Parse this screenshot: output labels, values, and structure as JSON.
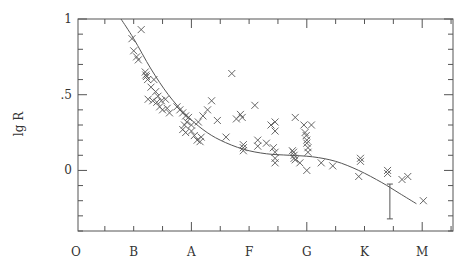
{
  "chart_data": {
    "type": "scatter",
    "title": "",
    "xlabel": "",
    "ylabel": "lg R",
    "x_categories": [
      "O",
      "B",
      "A",
      "F",
      "G",
      "K",
      "M"
    ],
    "x_category_positions": [
      0,
      1,
      2,
      3,
      4,
      5,
      6
    ],
    "xlim": [
      0.03,
      6.53
    ],
    "ylim": [
      -0.4,
      1.0
    ],
    "y_ticks": [
      {
        "value": 1,
        "label": "1"
      },
      {
        "value": 0.5,
        "label": ".5"
      },
      {
        "value": 0,
        "label": "0"
      }
    ],
    "y_minor_step": 0.1,
    "x_minor_step": 0.5,
    "grid": false,
    "legend": null,
    "marker": "x",
    "series": [
      {
        "name": "stars",
        "points": [
          [
            1.13,
            0.93
          ],
          [
            0.97,
            0.87
          ],
          [
            1.0,
            0.79
          ],
          [
            1.05,
            0.75
          ],
          [
            1.08,
            0.73
          ],
          [
            1.2,
            0.65
          ],
          [
            1.22,
            0.62
          ],
          [
            1.24,
            0.6
          ],
          [
            1.21,
            0.63
          ],
          [
            1.35,
            0.6
          ],
          [
            1.3,
            0.55
          ],
          [
            1.38,
            0.52
          ],
          [
            1.42,
            0.49
          ],
          [
            1.25,
            0.47
          ],
          [
            1.33,
            0.46
          ],
          [
            1.4,
            0.45
          ],
          [
            1.48,
            0.46
          ],
          [
            1.55,
            0.47
          ],
          [
            1.45,
            0.42
          ],
          [
            1.5,
            0.4
          ],
          [
            1.58,
            0.41
          ],
          [
            1.62,
            0.38
          ],
          [
            1.75,
            0.42
          ],
          [
            1.8,
            0.4
          ],
          [
            1.85,
            0.38
          ],
          [
            1.9,
            0.36
          ],
          [
            1.92,
            0.32
          ],
          [
            1.95,
            0.35
          ],
          [
            2.0,
            0.3
          ],
          [
            2.0,
            0.26
          ],
          [
            1.85,
            0.27
          ],
          [
            1.88,
            0.3
          ],
          [
            1.9,
            0.25
          ],
          [
            2.05,
            0.23
          ],
          [
            2.1,
            0.2
          ],
          [
            2.15,
            0.19
          ],
          [
            2.17,
            0.22
          ],
          [
            2.12,
            0.32
          ],
          [
            2.2,
            0.36
          ],
          [
            2.28,
            0.4
          ],
          [
            2.35,
            0.46
          ],
          [
            2.45,
            0.33
          ],
          [
            2.7,
            0.64
          ],
          [
            2.6,
            0.22
          ],
          [
            2.78,
            0.34
          ],
          [
            2.9,
            0.17
          ],
          [
            2.9,
            0.15
          ],
          [
            2.9,
            0.13
          ],
          [
            2.88,
            0.35
          ],
          [
            2.85,
            0.37
          ],
          [
            3.1,
            0.43
          ],
          [
            3.15,
            0.2
          ],
          [
            3.15,
            0.16
          ],
          [
            3.3,
            0.18
          ],
          [
            3.38,
            0.3
          ],
          [
            3.45,
            0.32
          ],
          [
            3.45,
            0.26
          ],
          [
            3.42,
            0.15
          ],
          [
            3.45,
            0.12
          ],
          [
            3.45,
            0.08
          ],
          [
            3.45,
            0.05
          ],
          [
            3.75,
            0.13
          ],
          [
            3.77,
            0.12
          ],
          [
            3.78,
            0.1
          ],
          [
            3.78,
            0.08
          ],
          [
            3.8,
            0.07
          ],
          [
            3.8,
            0.35
          ],
          [
            3.95,
            0.3
          ],
          [
            3.97,
            0.25
          ],
          [
            3.99,
            0.23
          ],
          [
            4.0,
            0.2
          ],
          [
            4.0,
            0.18
          ],
          [
            4.02,
            0.15
          ],
          [
            4.02,
            0.12
          ],
          [
            3.88,
            0.05
          ],
          [
            4.0,
            0.0
          ],
          [
            4.08,
            0.3
          ],
          [
            4.25,
            0.05
          ],
          [
            4.45,
            0.03
          ],
          [
            4.93,
            0.08
          ],
          [
            4.93,
            0.06
          ],
          [
            4.9,
            -0.04
          ],
          [
            5.4,
            0.0
          ],
          [
            5.4,
            -0.02
          ],
          [
            5.65,
            -0.06
          ],
          [
            5.75,
            -0.04
          ],
          [
            6.02,
            -0.2
          ]
        ]
      }
    ],
    "fit_curve": {
      "name": "mean relation",
      "points": [
        [
          0.78,
          1.0
        ],
        [
          1.0,
          0.87
        ],
        [
          1.3,
          0.67
        ],
        [
          1.6,
          0.5
        ],
        [
          1.9,
          0.37
        ],
        [
          2.2,
          0.27
        ],
        [
          2.5,
          0.2
        ],
        [
          2.9,
          0.14
        ],
        [
          3.3,
          0.11
        ],
        [
          3.7,
          0.1
        ],
        [
          4.1,
          0.09
        ],
        [
          4.5,
          0.06
        ],
        [
          4.9,
          0.0
        ],
        [
          5.3,
          -0.08
        ],
        [
          5.6,
          -0.15
        ],
        [
          5.9,
          -0.22
        ]
      ]
    },
    "error_bar": {
      "x": 5.44,
      "y_low": -0.32,
      "y_high": -0.09
    }
  }
}
